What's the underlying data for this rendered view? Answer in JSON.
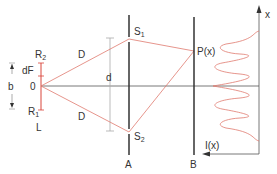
{
  "diagram": {
    "colors": {
      "ray": "#e07a6e",
      "source": "#d9453a",
      "intensity": "#e07a6e",
      "barrier": "#333333",
      "axis": "#555555",
      "dimension": "#aaaaaa"
    },
    "labels": {
      "source_top": "R",
      "source_top_sub": "2",
      "source_bottom": "R",
      "source_bottom_sub": "1",
      "source_name": "L",
      "origin": "0",
      "source_segment": "dF",
      "source_width": "b",
      "distance_upper": "D",
      "distance_lower": "D",
      "slit_separation": "d",
      "slit_upper": "S",
      "slit_upper_sub": "1",
      "slit_lower": "S",
      "slit_lower_sub": "2",
      "barrier_a": "A",
      "barrier_b": "B",
      "point": "P(x)",
      "x_axis": "x",
      "intensity_axis": "I(x)"
    }
  }
}
